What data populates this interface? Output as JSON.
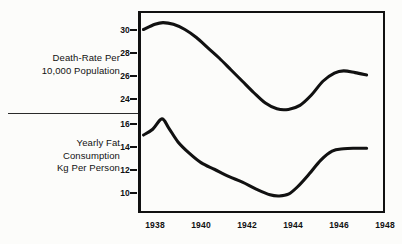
{
  "figure": {
    "background_color": "#fcfcfa",
    "ink_color": "#111111"
  },
  "panels": {
    "top": {
      "title": "Death-Rate Per\n10,000 Population",
      "y_ticks": [
        "30",
        "28",
        "26",
        "24"
      ]
    },
    "bottom": {
      "title": "Yearly Fat\nConsumption\nKg Per Person",
      "y_ticks": [
        "16",
        "14",
        "12",
        "10"
      ]
    }
  },
  "x_axis": {
    "tick_labels": [
      "1938",
      "1940",
      "1942",
      "1944",
      "1946",
      "1948"
    ]
  },
  "chart_data": [
    {
      "type": "line",
      "title": "Death-Rate Per 10,000 Population",
      "xlabel": "",
      "ylabel": "Death-Rate Per 10,000 Population",
      "xlim": [
        1937.5,
        1948.7
      ],
      "ylim": [
        22.6,
        31.0
      ],
      "yticks": [
        30,
        28,
        26,
        24
      ],
      "xticks": [
        1938,
        1940,
        1942,
        1944,
        1946,
        1948
      ],
      "grid": false,
      "legend": "none",
      "series": [
        {
          "name": "Death rate per 10,000 population",
          "x": [
            1937.5,
            1938.0,
            1938.35,
            1938.8,
            1939.3,
            1939.8,
            1940.3,
            1940.8,
            1941.3,
            1941.8,
            1942.3,
            1942.8,
            1943.3,
            1943.8,
            1944.3,
            1944.8,
            1945.3,
            1945.8,
            1946.2,
            1946.7,
            1947.2
          ],
          "values": [
            30.0,
            30.45,
            30.6,
            30.45,
            30.0,
            29.3,
            28.4,
            27.5,
            26.5,
            25.5,
            24.5,
            23.6,
            23.1,
            23.05,
            23.4,
            24.3,
            25.5,
            26.2,
            26.4,
            26.25,
            26.05
          ]
        }
      ]
    },
    {
      "type": "line",
      "title": "Yearly Fat Consumption Kg Per Person",
      "xlabel": "",
      "ylabel": "Yearly Fat Consumption Kg Per Person",
      "xlim": [
        1937.5,
        1948.7
      ],
      "ylim": [
        8.9,
        16.9
      ],
      "yticks": [
        16,
        14,
        12,
        10
      ],
      "xticks": [
        1938,
        1940,
        1942,
        1944,
        1946,
        1948
      ],
      "grid": false,
      "legend": "none",
      "series": [
        {
          "name": "Yearly fat consumption, kg per person",
          "x": [
            1937.5,
            1937.9,
            1938.3,
            1938.6,
            1939.0,
            1939.5,
            1940.0,
            1940.6,
            1941.2,
            1941.8,
            1942.4,
            1943.0,
            1943.4,
            1943.8,
            1944.2,
            1944.7,
            1945.2,
            1945.7,
            1946.2,
            1946.7,
            1947.2
          ],
          "values": [
            15.0,
            15.5,
            16.4,
            15.6,
            14.4,
            13.4,
            12.6,
            12.0,
            11.4,
            10.9,
            10.3,
            9.8,
            9.7,
            9.85,
            10.5,
            11.6,
            12.8,
            13.6,
            13.8,
            13.85,
            13.85
          ]
        }
      ]
    }
  ]
}
